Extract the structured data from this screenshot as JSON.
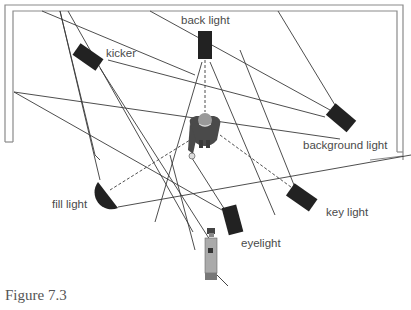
{
  "figure": {
    "caption": "Figure 7.3"
  },
  "labels": {
    "back_light": "back light",
    "kicker": "kicker",
    "background_light": "background light",
    "fill_light": "fill light",
    "key_light": "key light",
    "eyelight": "eyelight"
  },
  "colors": {
    "wall": "#8a8a8a",
    "beam_line": "#3a3a3a",
    "fixture": "#222222",
    "subject": "#5a5a5a",
    "camera": "#9a9a9a",
    "text": "#4a4a4a"
  },
  "elements": [
    {
      "name": "back light",
      "shape": "rectangle",
      "position": "top center"
    },
    {
      "name": "kicker",
      "shape": "rectangle",
      "position": "upper left"
    },
    {
      "name": "background light",
      "shape": "rectangle",
      "position": "right"
    },
    {
      "name": "fill light",
      "shape": "half-circle",
      "position": "lower left"
    },
    {
      "name": "key light",
      "shape": "rectangle",
      "position": "lower right"
    },
    {
      "name": "eyelight",
      "shape": "rectangle",
      "position": "bottom center"
    },
    {
      "name": "subject",
      "shape": "person-top-view",
      "position": "center"
    },
    {
      "name": "camera",
      "shape": "camera-top-view",
      "position": "bottom"
    }
  ]
}
